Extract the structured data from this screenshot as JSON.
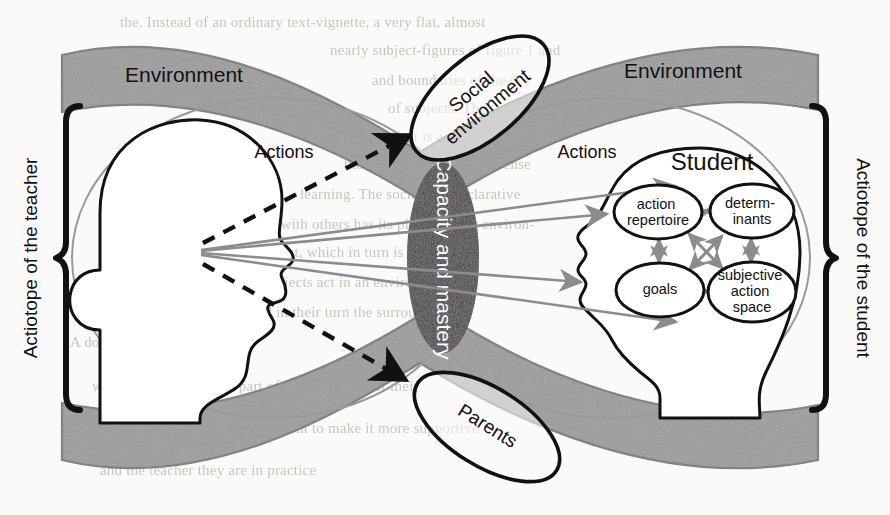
{
  "figure": {
    "background_color": "#fbfaf8",
    "band_color": "#a9a9a9",
    "band_edge_color": "#8a8a8a",
    "core_color": "#333333",
    "outline_color": "#111111",
    "arrow_gray": "#8c8c8c"
  },
  "brackets": {
    "left": {
      "label": "Actiotope of the teacher",
      "color": "#111111"
    },
    "right": {
      "label": "Actiotope of the student",
      "color": "#111111"
    }
  },
  "bands": {
    "left_label": "Environment",
    "right_label": "Environment"
  },
  "core": {
    "label": "Capacity and mastery",
    "text_color": "#ffffff"
  },
  "heads": {
    "teacher": {
      "label": "",
      "actions_label": "Actions"
    },
    "student": {
      "label": "Student",
      "actions_label": "Actions"
    }
  },
  "satellites": [
    {
      "name": "social-environment",
      "label": "Social environment",
      "rotation_deg": -38
    },
    {
      "name": "parents",
      "label": "Parents",
      "rotation_deg": 34
    }
  ],
  "student_nodes": [
    {
      "id": "action-repertoire",
      "label_lines": [
        "action",
        "repertoire"
      ],
      "cx": 658,
      "cy": 212,
      "rx": 42,
      "ry": 26
    },
    {
      "id": "determinants",
      "label_lines": [
        "determ-",
        "inants"
      ],
      "cx": 751,
      "cy": 211,
      "rx": 40,
      "ry": 26
    },
    {
      "id": "goals",
      "label_lines": [
        "goals"
      ],
      "cx": 660,
      "cy": 290,
      "rx": 42,
      "ry": 26
    },
    {
      "id": "subjective-action-space",
      "label_lines": [
        "subjective",
        "action",
        "space"
      ],
      "cx": 752,
      "cy": 292,
      "rx": 42,
      "ry": 29
    }
  ],
  "student_links": [
    {
      "from": "action-repertoire",
      "to": "determinants",
      "double": true
    },
    {
      "from": "goals",
      "to": "subjective-action-space",
      "double": true
    },
    {
      "from": "action-repertoire",
      "to": "goals",
      "double": true
    },
    {
      "from": "determinants",
      "to": "subjective-action-space",
      "double": true
    },
    {
      "from": "action-repertoire",
      "to": "subjective-action-space",
      "double": true
    },
    {
      "from": "goals",
      "to": "determinants",
      "double": true
    }
  ],
  "teacher_action_lines": 4,
  "dashed_arrows": 2,
  "ghost_text": [
    {
      "text": "the. Instead of an ordinary text-vignette, a very flat, almost",
      "x": 120,
      "y": 14,
      "size": 15,
      "mirror": false
    },
    {
      "text": "nearly subject-figures of figure 1 and",
      "x": 330,
      "y": 42,
      "size": 15,
      "mirror": false
    },
    {
      "text": "and boundaries of the dev",
      "x": 372,
      "y": 72,
      "size": 15,
      "mirror": false
    },
    {
      "text": "of subjects. The teacher",
      "x": 388,
      "y": 100,
      "size": 15,
      "mirror": false
    },
    {
      "text": "with Gagné, it is a constrained sub-",
      "x": 330,
      "y": 128,
      "size": 15,
      "mirror": false
    },
    {
      "text": "the student, in a broader sense",
      "x": 344,
      "y": 156,
      "size": 15,
      "mirror": false
    },
    {
      "text": "learning. The social and declarative",
      "x": 300,
      "y": 186,
      "size": 15,
      "mirror": false
    },
    {
      "text": "that one can see with others has its place in their environ-",
      "x": 178,
      "y": 216,
      "size": 15,
      "mirror": false
    },
    {
      "text": "ment, which in turn is presented",
      "x": 268,
      "y": 244,
      "size": 15,
      "mirror": false
    },
    {
      "text": "the subjects act in an environment",
      "x": 240,
      "y": 274,
      "size": 15,
      "mirror": false
    },
    {
      "text": "and in their turn the surrounding",
      "x": 250,
      "y": 304,
      "size": 15,
      "mirror": false
    },
    {
      "text": "A dominating learning goal",
      "x": 70,
      "y": 334,
      "size": 15,
      "mirror": false
    },
    {
      "text": "within a curriculum, as part of the regulation of their",
      "x": 92,
      "y": 378,
      "size": 15,
      "mirror": false
    },
    {
      "text": "environment to make it more supportive",
      "x": 230,
      "y": 420,
      "size": 15,
      "mirror": false
    },
    {
      "text": "and the teacher they are in practice",
      "x": 100,
      "y": 462,
      "size": 15,
      "mirror": false
    }
  ]
}
